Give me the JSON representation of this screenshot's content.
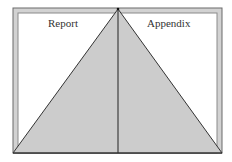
{
  "diagram": {
    "type": "document-binder-triangle",
    "labels": {
      "left": "Report",
      "right": "Appendix"
    },
    "colors": {
      "background": "#ffffff",
      "frame_fill": "#d0d0d0",
      "frame_stroke": "#555555",
      "triangle_fill": "#cccccc",
      "line": "#222222"
    }
  }
}
